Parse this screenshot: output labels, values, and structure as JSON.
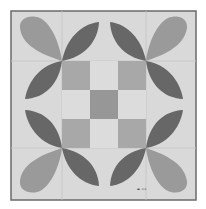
{
  "image": {
    "subject": "quilt block",
    "description": "Nine-patch center surrounded by eight leaf/petal shapes forming four flower motifs at the corners of the center square",
    "colors": {
      "background": "#ffffff",
      "fabric": "#d9d9d9",
      "seam": "#c4c4c4",
      "border": "#6a6a6a",
      "light_petal": "#9a9a9a",
      "dark_petal": "#676767",
      "center_square": "#a8a8a8",
      "center_middle": "#979797",
      "light_square": "#dcdcdc"
    },
    "label": "▬ ▫▫"
  }
}
